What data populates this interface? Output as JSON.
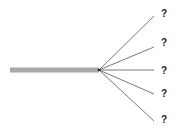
{
  "diagram": {
    "trunk": {
      "x1": 10,
      "y": 70,
      "x2": 99,
      "thickness": 5,
      "color": "#a8a8a8"
    },
    "origin": {
      "x": 99,
      "y": 70
    },
    "line_color": "#555555",
    "branches": [
      {
        "end_x": 154,
        "end_y": 16,
        "label": "?",
        "label_x": 161,
        "label_y": 9
      },
      {
        "end_x": 154,
        "end_y": 47,
        "label": "?",
        "label_x": 161,
        "label_y": 38
      },
      {
        "end_x": 154,
        "end_y": 70,
        "label": "?",
        "label_x": 161,
        "label_y": 66
      },
      {
        "end_x": 154,
        "end_y": 94,
        "label": "?",
        "label_x": 161,
        "label_y": 89
      },
      {
        "end_x": 154,
        "end_y": 121,
        "label": "?",
        "label_x": 161,
        "label_y": 115
      }
    ]
  }
}
